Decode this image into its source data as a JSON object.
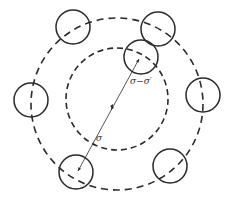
{
  "diagram": {
    "colors": {
      "stroke": "#2a2a2a",
      "background": "#ffffff"
    },
    "outer_ring": {
      "cx": 117,
      "cy": 104,
      "r": 86,
      "dash": "7 5"
    },
    "inner_ring": {
      "cx": 117,
      "cy": 99,
      "r": 51,
      "dash": "6 4"
    },
    "particles": [
      {
        "cx": 73,
        "cy": 27,
        "r": 17
      },
      {
        "cx": 158,
        "cy": 29,
        "r": 17
      },
      {
        "cx": 141,
        "cy": 57,
        "r": 17
      },
      {
        "cx": 31,
        "cy": 100,
        "r": 17
      },
      {
        "cx": 203,
        "cy": 95,
        "r": 17
      },
      {
        "cx": 76,
        "cy": 172,
        "r": 17
      },
      {
        "cx": 170,
        "cy": 166,
        "r": 17
      }
    ],
    "radius_line": {
      "x1": 78,
      "y1": 171,
      "x2": 139,
      "y2": 59
    },
    "labels": {
      "sigma": "σ",
      "sigma_diff": "σ−σ′"
    }
  }
}
